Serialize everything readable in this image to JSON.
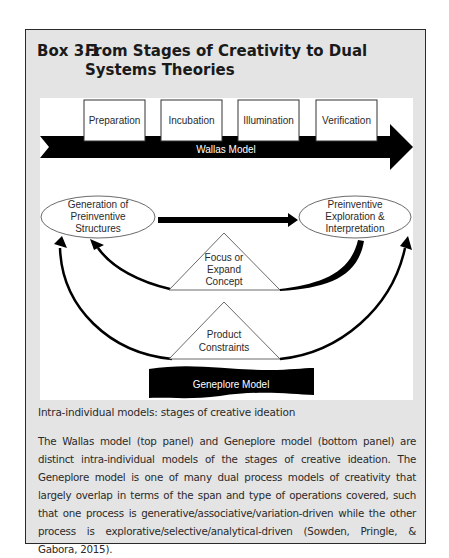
{
  "box": {
    "number": "Box 3.1",
    "title": "From Stages of Creativity to Dual Systems Theories"
  },
  "wallas": {
    "stages": [
      "Preparation",
      "Incubation",
      "Illumination",
      "Verification"
    ],
    "model_label": "Wallas Model"
  },
  "geneplore": {
    "left_node": [
      "Generation of",
      "Preinventive",
      "Structures"
    ],
    "right_node": [
      "Preinventive",
      "Exploration &",
      "Interpretation"
    ],
    "upper_triangle": [
      "Focus or",
      "Expand",
      "Concept"
    ],
    "lower_triangle": [
      "Product",
      "Constraints"
    ],
    "model_label": "Geneplore Model"
  },
  "caption": "Intra-individual models: stages of creative ideation",
  "body": "The Wallas model (top panel) and Geneplore model (bottom panel) are distinct intra-individual models of the stages of creative ideation. The Geneplore model is one of many dual process models of creativity that largely overlap in terms of the span and type of operations covered, such that one process is generative/associative/variation-driven while the other process is explorative/selective/analytical-driven (Sowden, Pringle, & Gabora, 2015)."
}
